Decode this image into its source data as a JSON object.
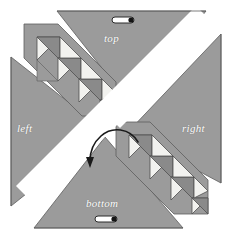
{
  "figure": {
    "title": "",
    "background": "#ffffff",
    "width": 232,
    "height": 238
  },
  "palette": {
    "panel_gray": "#9b9b9b",
    "panel_edge": "#5a5a5a",
    "tri_dark": "#8a8a8a",
    "tri_light": "#f2f2ef",
    "tri_edge": "#4f4f4f",
    "white_gap": "#ffffff",
    "label_color": "#ffffff",
    "arrow_color": "#1a1a1a",
    "handle_fill": "#ffffff",
    "handle_stroke": "#2b2b2b",
    "handle_dot": "#141414"
  },
  "panels": {
    "top": {
      "label": "top",
      "orientation": "down",
      "icon": "pill-handle"
    },
    "left": {
      "label": "left",
      "orientation": "right",
      "icon": "none"
    },
    "right": {
      "label": "right",
      "orientation": "left",
      "icon": "none"
    },
    "bottom": {
      "label": "bottom",
      "orientation": "up",
      "icon": "pill-handle"
    }
  },
  "center": {
    "icon": "rotate-arrow-icon",
    "direction": "counter-clockwise",
    "label": ""
  },
  "staircases": [
    {
      "name": "upper-left-staircase",
      "steps": 4,
      "light_color": "#f2f2ef",
      "dark_color": "#8a8a8a"
    },
    {
      "name": "lower-right-staircase",
      "steps": 4,
      "light_color": "#f2f2ef",
      "dark_color": "#8a8a8a"
    }
  ],
  "handles": [
    {
      "name": "top-handle",
      "shape": "pill-with-dot"
    },
    {
      "name": "bottom-handle",
      "shape": "pill-with-dot"
    }
  ]
}
